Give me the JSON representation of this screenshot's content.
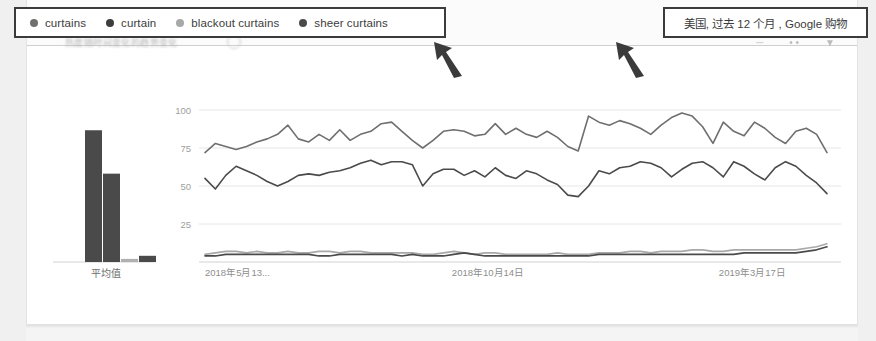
{
  "annotations": {
    "legend_box": {
      "items": [
        {
          "label": "curtains",
          "dot_color": "#6f6f6f"
        },
        {
          "label": "curtain",
          "dot_color": "#3d3d3d"
        },
        {
          "label": "blackout curtains",
          "dot_color": "#a8a8a8"
        },
        {
          "label": "sheer curtains",
          "dot_color": "#4a4a4a"
        }
      ],
      "border_color": "#3b3b3b"
    },
    "locale_box": {
      "label": "美国, 过去 12 个月 , Google 购物",
      "border_color": "#3b3b3b"
    },
    "arrow_color": "#3b3b3b",
    "arrow_count": 2
  },
  "header": {
    "obscured_text": "热度随时间变化的趋势变化",
    "icons": [
      "embed-icon",
      "share-icon",
      "download-icon",
      "more-icon"
    ]
  },
  "chart_data": [
    {
      "type": "bar",
      "name": "average-bar-chart",
      "title": "",
      "categories": [
        "curtains",
        "curtain",
        "blackout curtains",
        "sheer curtains"
      ],
      "values": [
        85,
        57,
        2,
        4
      ],
      "xlabel": "平均值",
      "ylabel": "",
      "ylim": [
        0,
        100
      ],
      "grid": false,
      "bar_colors": [
        "#4a4a4a",
        "#4a4a4a",
        "#b0b0b0",
        "#4a4a4a"
      ]
    },
    {
      "type": "line",
      "name": "interest-over-time-chart",
      "title": "",
      "xlabel": "",
      "ylabel": "",
      "ylim": [
        0,
        100
      ],
      "yticks": [
        25,
        50,
        75,
        100
      ],
      "ytick_labels": [
        "25",
        "50",
        "75",
        "100"
      ],
      "xtick_labels": [
        "2018年5月13...",
        "2018年10月14日",
        "2019年3月17日"
      ],
      "xtick_positions": [
        0,
        0.455,
        0.88
      ],
      "grid": true,
      "legend_position": "top",
      "series": [
        {
          "name": "curtains",
          "color": "#6f6f6f",
          "values": [
            72,
            78,
            76,
            74,
            76,
            79,
            81,
            84,
            90,
            81,
            79,
            84,
            80,
            87,
            80,
            84,
            86,
            91,
            92,
            86,
            80,
            75,
            80,
            86,
            87,
            86,
            83,
            84,
            91,
            84,
            88,
            84,
            82,
            86,
            82,
            76,
            73,
            96,
            92,
            90,
            93,
            91,
            88,
            84,
            90,
            95,
            98,
            96,
            89,
            78,
            92,
            86,
            83,
            92,
            88,
            82,
            78,
            86,
            88,
            84,
            72
          ]
        },
        {
          "name": "curtain",
          "color": "#4a4a4a",
          "values": [
            55,
            48,
            57,
            63,
            60,
            57,
            53,
            50,
            53,
            57,
            58,
            57,
            59,
            60,
            62,
            65,
            67,
            64,
            66,
            66,
            64,
            50,
            58,
            61,
            61,
            57,
            60,
            56,
            62,
            57,
            55,
            60,
            58,
            54,
            51,
            44,
            43,
            50,
            60,
            58,
            62,
            63,
            66,
            65,
            62,
            56,
            61,
            65,
            66,
            62,
            56,
            66,
            63,
            58,
            54,
            62,
            66,
            63,
            57,
            52,
            45
          ]
        },
        {
          "name": "blackout curtains",
          "color": "#a8a8a8",
          "values": [
            5,
            6,
            7,
            7,
            6,
            7,
            6,
            6,
            7,
            6,
            6,
            7,
            7,
            6,
            7,
            7,
            6,
            6,
            6,
            6,
            6,
            5,
            5,
            6,
            7,
            6,
            5,
            6,
            6,
            5,
            5,
            5,
            5,
            5,
            6,
            5,
            5,
            5,
            6,
            6,
            6,
            7,
            7,
            6,
            7,
            7,
            7,
            8,
            8,
            7,
            7,
            8,
            8,
            8,
            8,
            8,
            8,
            8,
            9,
            10,
            12
          ]
        },
        {
          "name": "sheer curtains",
          "color": "#4a4a4a",
          "values": [
            4,
            4,
            5,
            5,
            5,
            5,
            5,
            5,
            5,
            5,
            5,
            4,
            4,
            5,
            5,
            5,
            5,
            5,
            5,
            4,
            5,
            4,
            4,
            4,
            5,
            6,
            5,
            4,
            4,
            4,
            4,
            4,
            4,
            4,
            4,
            4,
            4,
            4,
            5,
            5,
            5,
            5,
            5,
            5,
            5,
            5,
            5,
            5,
            5,
            5,
            5,
            5,
            6,
            6,
            6,
            6,
            6,
            6,
            7,
            8,
            10
          ]
        }
      ]
    }
  ]
}
